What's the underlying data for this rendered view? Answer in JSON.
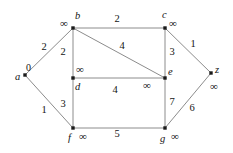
{
  "figure": {
    "type": "weighted-undirected-graph",
    "infinity_symbol": "∞",
    "edge_color": "#8c8c8c",
    "node_color": "#1a1a1a",
    "text_color": "#141414",
    "background": "#ffffff"
  },
  "nodes": [
    {
      "id": "a",
      "label": "a",
      "dist": "0",
      "x": 25,
      "y": 75,
      "name_dx": -10,
      "name_dy": -3,
      "dist_dx": 1,
      "dist_dy": -12
    },
    {
      "id": "b",
      "label": "b",
      "dist": "∞",
      "x": 73,
      "y": 28,
      "name_dx": 2,
      "name_dy": -17,
      "dist_dx": -13,
      "dist_dy": -10
    },
    {
      "id": "c",
      "label": "c",
      "dist": "∞",
      "x": 165,
      "y": 28,
      "name_dx": -3,
      "name_dy": -18,
      "dist_dx": 4,
      "dist_dy": -10
    },
    {
      "id": "d",
      "label": "d",
      "dist": "∞",
      "x": 73,
      "y": 78,
      "name_dx": 2,
      "name_dy": 4,
      "dist_dx": 3,
      "dist_dy": -14
    },
    {
      "id": "e",
      "label": "e",
      "dist": "∞",
      "x": 165,
      "y": 78,
      "name_dx": 3,
      "name_dy": -11,
      "dist_dx": -22,
      "dist_dy": 2
    },
    {
      "id": "f",
      "label": "f",
      "dist": "∞",
      "x": 73,
      "y": 128,
      "name_dx": -5,
      "name_dy": 5,
      "dist_dx": 6,
      "dist_dy": 3
    },
    {
      "id": "g",
      "label": "g",
      "dist": "∞",
      "x": 165,
      "y": 128,
      "name_dx": -5,
      "name_dy": 6,
      "dist_dx": 6,
      "dist_dy": 3
    },
    {
      "id": "z",
      "label": "z",
      "dist": "∞",
      "x": 211,
      "y": 73,
      "name_dx": 4,
      "name_dy": -8,
      "dist_dx": -1,
      "dist_dy": 8
    }
  ],
  "edges": [
    {
      "from": "a",
      "to": "b",
      "weight": "2",
      "lx": 44,
      "ly": 47
    },
    {
      "from": "a",
      "to": "f",
      "weight": "1",
      "lx": 44,
      "ly": 110
    },
    {
      "from": "b",
      "to": "c",
      "weight": "2",
      "lx": 117,
      "ly": 19
    },
    {
      "from": "b",
      "to": "d",
      "weight": "2",
      "lx": 63,
      "ly": 52
    },
    {
      "from": "b",
      "to": "e",
      "weight": "4",
      "lx": 122,
      "ly": 46
    },
    {
      "from": "c",
      "to": "e",
      "weight": "3",
      "lx": 172,
      "ly": 52
    },
    {
      "from": "c",
      "to": "z",
      "weight": "1",
      "lx": 193,
      "ly": 44
    },
    {
      "from": "d",
      "to": "e",
      "weight": "4",
      "lx": 115,
      "ly": 90
    },
    {
      "from": "d",
      "to": "f",
      "weight": "3",
      "lx": 63,
      "ly": 104
    },
    {
      "from": "e",
      "to": "g",
      "weight": "7",
      "lx": 172,
      "ly": 102
    },
    {
      "from": "f",
      "to": "g",
      "weight": "5",
      "lx": 117,
      "ly": 134
    },
    {
      "from": "g",
      "to": "z",
      "weight": "6",
      "lx": 192,
      "ly": 108
    }
  ]
}
